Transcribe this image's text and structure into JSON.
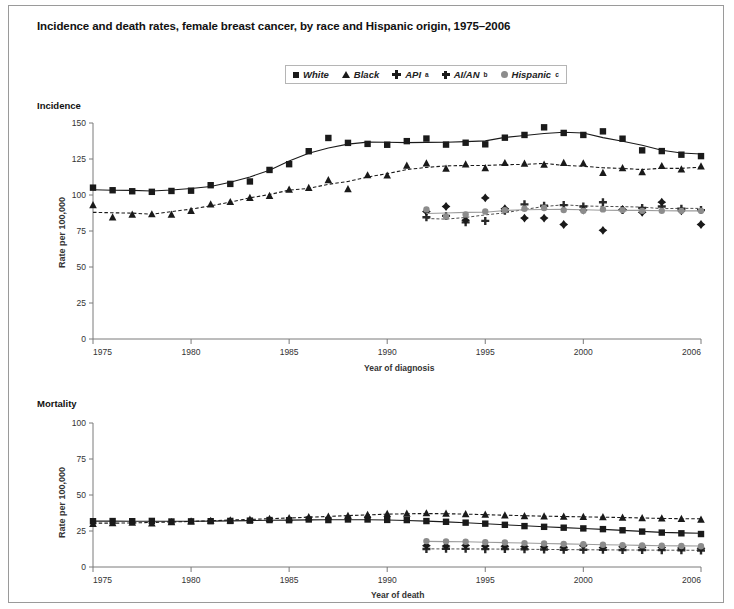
{
  "figure": {
    "title": "Incidence and death rates, female breast cancer, by race and Hispanic origin, 1975–2006"
  },
  "legend": {
    "position": "top-center",
    "items": [
      {
        "label": "White",
        "marker": "square-marker",
        "sup": ""
      },
      {
        "label": "Black",
        "marker": "triangle-marker",
        "sup": ""
      },
      {
        "label": "API",
        "marker": "plus-marker",
        "sup": "a"
      },
      {
        "label": "AI/AN",
        "marker": "diamond-marker",
        "sup": "b"
      },
      {
        "label": "Hispanic",
        "marker": "circle-marker",
        "sup": "c"
      }
    ]
  },
  "panels": {
    "incidence": {
      "header": "Incidence",
      "ylabel": "Rate per 100,000",
      "xlabel": "Year of diagnosis"
    },
    "mortality": {
      "header": "Mortality",
      "ylabel": "Rate per 100,000",
      "xlabel": "Year of death"
    }
  },
  "chart_data": [
    {
      "type": "scatter",
      "title": "Incidence",
      "xlabel": "Year of diagnosis",
      "ylabel": "Rate per 100,000",
      "xlim": [
        1975,
        2006
      ],
      "ylim": [
        0,
        150
      ],
      "yticks": [
        0,
        25,
        50,
        75,
        100,
        125,
        150
      ],
      "xticks": [
        1975,
        1980,
        1985,
        1990,
        1995,
        2000,
        2006
      ],
      "grid": false,
      "legend": "top-center",
      "series": [
        {
          "name": "White",
          "marker": "square",
          "color": "#1a1a1a",
          "line": "solid",
          "x": [
            1975,
            1976,
            1977,
            1978,
            1979,
            1980,
            1981,
            1982,
            1983,
            1984,
            1985,
            1986,
            1987,
            1988,
            1989,
            1990,
            1991,
            1992,
            1993,
            1994,
            1995,
            1996,
            1997,
            1998,
            1999,
            2000,
            2001,
            2002,
            2003,
            2004,
            2005,
            2006
          ],
          "values": [
            105.1,
            103.3,
            102.6,
            102.2,
            102.8,
            103.0,
            106.8,
            107.7,
            109.4,
            117.4,
            121.4,
            130.4,
            139.6,
            136.2,
            135.5,
            134.9,
            137.4,
            139.2,
            135.0,
            136.3,
            135.2,
            139.8,
            141.7,
            147.0,
            143.1,
            141.7,
            144.2,
            139.1,
            131.0,
            130.5,
            128.0,
            127.0
          ]
        },
        {
          "name": "Black",
          "marker": "triangle",
          "color": "#1a1a1a",
          "line": "dashed",
          "x": [
            1975,
            1976,
            1977,
            1978,
            1979,
            1980,
            1981,
            1982,
            1983,
            1984,
            1985,
            1986,
            1987,
            1988,
            1989,
            1990,
            1991,
            1992,
            1993,
            1994,
            1995,
            1996,
            1997,
            1998,
            1999,
            2000,
            2001,
            2002,
            2003,
            2004,
            2005,
            2006
          ],
          "values": [
            93.0,
            84.5,
            86.4,
            86.7,
            86.5,
            89.0,
            93.6,
            95.2,
            98.1,
            99.5,
            103.8,
            105.0,
            110.4,
            104.2,
            113.8,
            113.6,
            120.5,
            122.0,
            118.4,
            121.3,
            118.7,
            122.3,
            121.8,
            121.2,
            122.4,
            122.0,
            115.5,
            118.7,
            115.9,
            120.2,
            117.9,
            120.0
          ]
        },
        {
          "name": "API",
          "marker": "plus",
          "color": "#2a2a2a",
          "line": "dashed-thin",
          "x": [
            1992,
            1993,
            1994,
            1995,
            1996,
            1997,
            1998,
            1999,
            2000,
            2001,
            2002,
            2003,
            2004,
            2005,
            2006
          ],
          "values": [
            84.5,
            85.5,
            81.0,
            82.0,
            89.0,
            93.5,
            92.5,
            93.0,
            92.0,
            95.0,
            89.5,
            91.0,
            92.0,
            90.5,
            89.5
          ]
        },
        {
          "name": "AI/AN",
          "marker": "diamond",
          "color": "#1a1a1a",
          "line": "none",
          "x": [
            1992,
            1993,
            1994,
            1995,
            1996,
            1997,
            1998,
            1999,
            2000,
            2001,
            2002,
            2003,
            2004,
            2005,
            2006
          ],
          "values": [
            88.5,
            92.0,
            82.5,
            98.0,
            90.5,
            84.0,
            84.0,
            79.5,
            89.5,
            75.5,
            90.0,
            88.0,
            95.0,
            89.0,
            79.5
          ]
        },
        {
          "name": "Hispanic",
          "marker": "circle",
          "color": "#8c8c8c",
          "line": "solid-gray",
          "x": [
            1992,
            1993,
            1994,
            1995,
            1996,
            1997,
            1998,
            1999,
            2000,
            2001,
            2002,
            2003,
            2004,
            2005,
            2006
          ],
          "values": [
            90.0,
            85.0,
            86.5,
            88.5,
            89.5,
            90.5,
            91.0,
            89.5,
            89.0,
            90.0,
            89.5,
            89.0,
            89.0,
            89.0,
            89.0
          ]
        }
      ]
    },
    {
      "type": "scatter",
      "title": "Mortality",
      "xlabel": "Year of death",
      "ylabel": "Rate per 100,000",
      "xlim": [
        1975,
        2006
      ],
      "ylim": [
        0,
        100
      ],
      "yticks": [
        0,
        25,
        50,
        75,
        100
      ],
      "xticks": [
        1975,
        1980,
        1985,
        1990,
        1995,
        2000,
        2006
      ],
      "grid": false,
      "legend": "top-center",
      "series": [
        {
          "name": "White",
          "marker": "square",
          "color": "#1a1a1a",
          "line": "solid",
          "x": [
            1975,
            1976,
            1977,
            1978,
            1979,
            1980,
            1981,
            1982,
            1983,
            1984,
            1985,
            1986,
            1987,
            1988,
            1989,
            1990,
            1991,
            1992,
            1993,
            1994,
            1995,
            1996,
            1997,
            1998,
            1999,
            2000,
            2001,
            2002,
            2003,
            2004,
            2005,
            2006
          ],
          "values": [
            31.8,
            31.9,
            31.8,
            32.0,
            31.6,
            31.7,
            31.8,
            32.0,
            32.2,
            32.6,
            32.5,
            33.0,
            32.6,
            33.0,
            33.0,
            32.7,
            32.6,
            31.9,
            31.4,
            30.8,
            30.1,
            29.3,
            28.4,
            27.9,
            27.3,
            26.8,
            26.3,
            25.5,
            24.6,
            23.9,
            23.4,
            22.9
          ]
        },
        {
          "name": "Black",
          "marker": "triangle",
          "color": "#1a1a1a",
          "line": "dashed",
          "x": [
            1975,
            1976,
            1977,
            1978,
            1979,
            1980,
            1981,
            1982,
            1983,
            1984,
            1985,
            1986,
            1987,
            1988,
            1989,
            1990,
            1991,
            1992,
            1993,
            1994,
            1995,
            1996,
            1997,
            1998,
            1999,
            2000,
            2001,
            2002,
            2003,
            2004,
            2005,
            2006
          ],
          "values": [
            30.0,
            30.6,
            30.8,
            30.4,
            31.2,
            31.8,
            32.2,
            32.5,
            33.0,
            33.5,
            34.0,
            34.7,
            35.0,
            35.6,
            36.2,
            37.0,
            37.2,
            37.4,
            37.1,
            36.8,
            36.5,
            35.9,
            35.4,
            35.2,
            35.1,
            34.9,
            34.7,
            34.3,
            34.0,
            33.8,
            33.5,
            33.0
          ]
        },
        {
          "name": "API",
          "marker": "plus",
          "color": "#2a2a2a",
          "line": "dashed-thin",
          "x": [
            1992,
            1993,
            1994,
            1995,
            1996,
            1997,
            1998,
            1999,
            2000,
            2001,
            2002,
            2003,
            2004,
            2005,
            2006
          ],
          "values": [
            12.5,
            12.7,
            12.6,
            12.4,
            12.5,
            12.3,
            12.2,
            12.0,
            12.0,
            11.9,
            11.8,
            11.8,
            11.7,
            11.6,
            11.5
          ]
        },
        {
          "name": "AI/AN",
          "marker": "diamond",
          "color": "#1a1a1a",
          "line": "none",
          "x": [
            1992,
            1993,
            1994,
            1995,
            1996,
            1997,
            1998,
            1999,
            2000,
            2001,
            2002,
            2003,
            2004,
            2005,
            2006
          ],
          "values": [
            14.8,
            14.5,
            15.0,
            14.6,
            14.4,
            14.2,
            14.0,
            13.8,
            14.8,
            13.5,
            14.0,
            13.8,
            13.5,
            13.2,
            13.0
          ]
        },
        {
          "name": "Hispanic",
          "marker": "circle",
          "color": "#8c8c8c",
          "line": "solid-gray",
          "x": [
            1992,
            1993,
            1994,
            1995,
            1996,
            1997,
            1998,
            1999,
            2000,
            2001,
            2002,
            2003,
            2004,
            2005,
            2006
          ],
          "values": [
            18.0,
            17.8,
            17.5,
            17.2,
            17.0,
            16.6,
            16.3,
            16.0,
            15.8,
            15.5,
            15.2,
            15.0,
            14.8,
            14.6,
            14.4
          ]
        }
      ]
    }
  ]
}
